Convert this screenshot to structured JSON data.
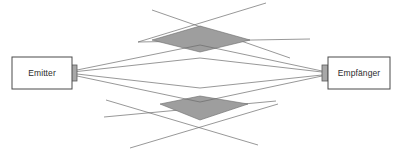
{
  "canvas": {
    "width": 397,
    "height": 154,
    "background": "#ffffff"
  },
  "colors": {
    "zone_fill": "#9e9e9e",
    "line": "#6b6b6b",
    "box_border": "#4a4a4a",
    "box_fill": "#ffffff",
    "tab_fill": "#a8a8a8",
    "text": "#2b2b2b"
  },
  "nodes": {
    "emitter": {
      "label": "Emitter",
      "x": 12,
      "y": 57,
      "width": 60,
      "height": 32,
      "label_cx": 42,
      "label_cy": 73.5
    },
    "receiver": {
      "label": "Empfänger",
      "x": 328,
      "y": 57,
      "width": 62,
      "height": 32,
      "label_cx": 359,
      "label_cy": 73.5
    }
  },
  "connectors": {
    "emitter_tab": {
      "x": 71,
      "y": 65,
      "width": 6,
      "height": 16
    },
    "receiver_tab": {
      "x": 322,
      "y": 65,
      "width": 6,
      "height": 16
    }
  },
  "rays": {
    "origin": {
      "x": 77,
      "y": 72
    },
    "target": {
      "x": 322,
      "y": 73
    },
    "paths": [
      {
        "name": "ray-upper-outer",
        "d": "M 77 70 L 200 45 L 322 71"
      },
      {
        "name": "ray-upper-inner",
        "d": "M 77 71.5 L 200 58 L 322 72"
      },
      {
        "name": "ray-lower-inner",
        "d": "M 77 74 L 200 88 L 322 75"
      },
      {
        "name": "ray-lower-outer",
        "d": "M 77 76 L 200 102 L 322 76"
      }
    ]
  },
  "zones": [
    {
      "name": "upper-fresnel-zone",
      "points": "152,40 200,26 250,40 200,52"
    },
    {
      "name": "lower-fresnel-zone",
      "points": "160,104 200,96 248,104 200,120"
    }
  ],
  "cross_lines": [
    {
      "name": "cross-upper-left-down",
      "d": "M 152 10 L 290 58"
    },
    {
      "name": "cross-upper-right-down",
      "d": "M 266 3 L 138 42"
    },
    {
      "name": "cross-upper-far-right",
      "d": "M 138 42 L 310 39"
    },
    {
      "name": "cross-lower-left-up",
      "d": "M 104 117 L 276 101"
    },
    {
      "name": "cross-lower-right-up",
      "d": "M 130 148 L 278 104"
    },
    {
      "name": "cross-lower-long",
      "d": "M 106 100 L 258 145"
    }
  ]
}
